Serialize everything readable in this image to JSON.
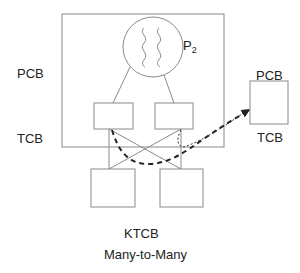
{
  "diagram": {
    "title": "Many-to-Many",
    "process_label": "P",
    "process_subscript": "2",
    "left_labels": {
      "pcb": "PCB",
      "tcb": "TCB"
    },
    "right_labels": {
      "pcb": "PCB",
      "tcb": "TCB"
    },
    "kernel_label": "KTCB",
    "colors": {
      "stroke": "#8a8a8a",
      "text": "#222222",
      "dashed": "#222222"
    },
    "nodes": [
      {
        "id": "process-box",
        "type": "rect",
        "x": 62,
        "y": 14,
        "w": 162,
        "h": 133
      },
      {
        "id": "process-circle",
        "type": "circle",
        "cx": 153,
        "cy": 47,
        "r": 30
      },
      {
        "id": "user-thread-left",
        "type": "rect",
        "x": 94,
        "y": 103,
        "w": 39,
        "h": 26
      },
      {
        "id": "user-thread-right",
        "type": "rect",
        "x": 155,
        "y": 103,
        "w": 38,
        "h": 26
      },
      {
        "id": "kernel-thread-left",
        "type": "rect",
        "x": 91,
        "y": 169,
        "w": 44,
        "h": 38
      },
      {
        "id": "kernel-thread-right",
        "type": "rect",
        "x": 160,
        "y": 169,
        "w": 43,
        "h": 38
      },
      {
        "id": "remote-process-box",
        "type": "rect",
        "x": 250,
        "y": 81,
        "w": 38,
        "h": 43
      }
    ],
    "edges": [
      {
        "from": "process-circle",
        "to": "user-thread-left",
        "style": "solid"
      },
      {
        "from": "process-circle",
        "to": "user-thread-right",
        "style": "solid"
      },
      {
        "from": "user-thread-left",
        "to": "kernel-thread-left",
        "style": "solid"
      },
      {
        "from": "user-thread-left",
        "to": "kernel-thread-right",
        "style": "solid"
      },
      {
        "from": "user-thread-right",
        "to": "kernel-thread-left",
        "style": "solid"
      },
      {
        "from": "user-thread-right",
        "to": "kernel-thread-right",
        "style": "solid"
      },
      {
        "from": "user-thread-left",
        "to": "remote-process-box",
        "style": "dashed-bold",
        "arrow": true
      },
      {
        "from": "user-thread-right",
        "to": "remote-process-box",
        "style": "dotted",
        "arrow": true
      }
    ]
  }
}
